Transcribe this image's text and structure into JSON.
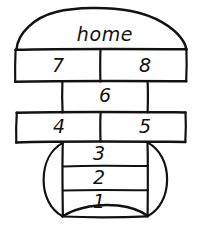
{
  "diagram": {
    "kind": "hopscotch-court",
    "title_label": "home",
    "ink_color": "#121212",
    "background_color": "#ffffff",
    "cells": [
      {
        "id": "cell-7",
        "label": "7",
        "row": "seven-eight",
        "side": "left",
        "cx": 58,
        "cy": 72
      },
      {
        "id": "cell-8",
        "label": "8",
        "row": "seven-eight",
        "side": "right",
        "cx": 145,
        "cy": 72
      },
      {
        "id": "cell-6",
        "label": "6",
        "row": "six",
        "side": "center",
        "cx": 105,
        "cy": 102
      },
      {
        "id": "cell-4",
        "label": "4",
        "row": "four-five",
        "side": "left",
        "cx": 59,
        "cy": 133
      },
      {
        "id": "cell-5",
        "label": "5",
        "row": "four-five",
        "side": "right",
        "cx": 145,
        "cy": 133
      },
      {
        "id": "cell-3",
        "label": "3",
        "row": "three",
        "side": "center",
        "cx": 99,
        "cy": 158
      },
      {
        "id": "cell-2",
        "label": "2",
        "row": "two",
        "side": "center",
        "cx": 99,
        "cy": 182
      },
      {
        "id": "cell-1",
        "label": "1",
        "row": "one",
        "side": "center",
        "cx": 99,
        "cy": 205
      }
    ]
  }
}
